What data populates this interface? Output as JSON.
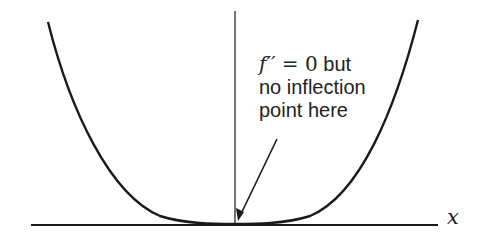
{
  "diagram": {
    "axis_label_x": "x",
    "annotation": {
      "math_func": "f′′",
      "math_eq": " = ",
      "math_value": "0",
      "line1_text": " but",
      "line2": "no inflection",
      "line3": "point here"
    },
    "curve_description": "y = x^4 style curve, flat at origin",
    "colors": {
      "stroke": "#1a1a1a",
      "background": "#ffffff"
    }
  }
}
